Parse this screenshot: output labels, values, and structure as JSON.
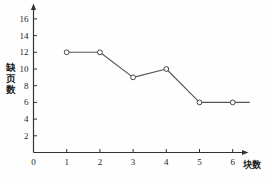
{
  "chart_data": {
    "type": "line",
    "title": "",
    "subtitle": "",
    "xlabel": "块数",
    "ylabel": "缺页数",
    "x": [
      1,
      2,
      3,
      4,
      5,
      6
    ],
    "values": [
      12,
      12,
      9,
      10,
      6,
      6
    ],
    "series": [
      {
        "name": "缺页数",
        "values": [
          12,
          12,
          9,
          10,
          6,
          6
        ]
      }
    ],
    "xlim": [
      0,
      6.6
    ],
    "ylim": [
      0,
      17
    ],
    "xticks": [
      "0",
      "1",
      "2",
      "3",
      "4",
      "5",
      "6"
    ],
    "xtick_values": [
      0,
      1,
      2,
      3,
      4,
      5,
      6
    ],
    "yticks": [
      "2",
      "4",
      "6",
      "8",
      "10",
      "12",
      "14",
      "16"
    ],
    "ytick_values": [
      2,
      4,
      6,
      8,
      10,
      12,
      14,
      16
    ],
    "grid": false,
    "legend": null,
    "marker": "open-circle",
    "line_color": "#555555",
    "marker_edge_color": "#444444",
    "marker_face_color": "#ffffff",
    "axis_color": "#333333",
    "line_extends_past_last_point": true,
    "annotations": []
  },
  "axis_labels": {
    "y_chars": [
      "缺",
      "页",
      "数"
    ],
    "x_text": "块数"
  }
}
